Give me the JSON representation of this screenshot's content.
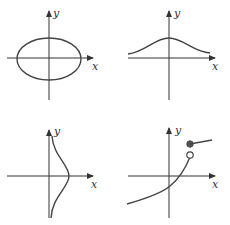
{
  "figure": {
    "panels": [
      {
        "id": "a",
        "description": "ellipse centered at origin",
        "x_label": "x",
        "y_label": "y"
      },
      {
        "id": "b",
        "description": "bell-shaped curve above x-axis, peak on y-axis",
        "x_label": "x",
        "y_label": "y"
      },
      {
        "id": "c",
        "description": "sideways bell curve opening right of y-axis",
        "x_label": "x",
        "y_label": "y"
      },
      {
        "id": "d",
        "description": "increasing curve with jump discontinuity: open circle then filled dot above",
        "x_label": "x",
        "y_label": "y"
      }
    ]
  }
}
